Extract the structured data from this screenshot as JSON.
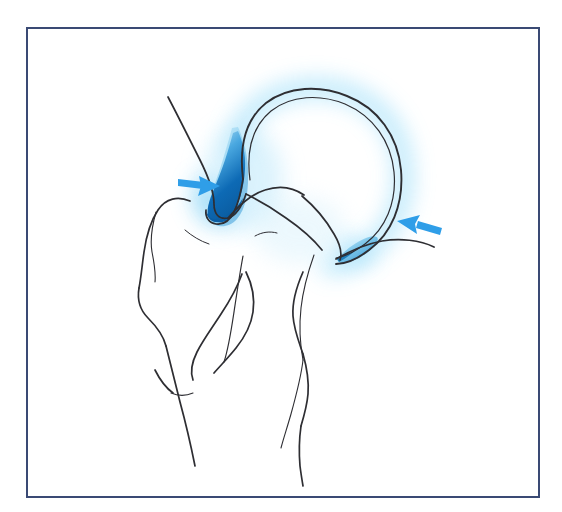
{
  "figure": {
    "kind": "anatomical-line-illustration",
    "subject": "shoulder joint (proximal humerus / glenohumeral joint), anterior view",
    "caption": "",
    "background_color": "#ffffff"
  },
  "frame": {
    "border_color": "#3a4a74",
    "border_width_px": 2,
    "x": 26,
    "y": 27,
    "width": 514,
    "height": 471,
    "fill": "#ffffff"
  },
  "palette": {
    "line_ink": "#2e2e33",
    "line_ink_soft": "#4a4a52",
    "arrow_blue": "#2f9ee8",
    "arrow_blue_dark": "#1b86d6",
    "highlight_deep_blue": "#0b64b0",
    "highlight_mid_blue": "#4aa8e0",
    "highlight_light_blue": "#9fd6f2",
    "glow_cyan": "#b9e8fb",
    "frame_navy": "#3a4a74"
  },
  "structures": [
    {
      "id": "humeral-head",
      "label": "humeral head",
      "render": "double-line arc with cyan glow halo",
      "stroke": "#2e2e33"
    },
    {
      "id": "articular-cartilage-line",
      "label": "articular cartilage surface (inner parallel line)",
      "render": "thin inner arc parallel to humeral head contour",
      "stroke": "#2e2e33"
    },
    {
      "id": "acromion-glenoid-margin",
      "label": "superior glenoid / acromial margin",
      "render": "descending curve from upper left",
      "stroke": "#2e2e33"
    },
    {
      "id": "greater-tuberosity",
      "label": "greater tuberosity",
      "render": "outline curve",
      "stroke": "#2e2e33"
    },
    {
      "id": "lesser-tuberosity",
      "label": "lesser tuberosity",
      "render": "outline curve",
      "stroke": "#2e2e33"
    },
    {
      "id": "bicipital-groove",
      "label": "intertubercular (bicipital) groove",
      "render": "paired vertical curves",
      "stroke": "#2e2e33"
    },
    {
      "id": "humeral-shaft",
      "label": "humeral shaft",
      "render": "two long descending cortical lines",
      "stroke": "#2e2e33"
    },
    {
      "id": "surgical-neck",
      "label": "surgical neck of humerus",
      "render": "narrowing between head and shaft",
      "stroke": "#2e2e33"
    }
  ],
  "highlights": [
    {
      "id": "superior-highlight",
      "label": "superior joint space highlight",
      "position": "superomedial, at the glenohumeral articulation",
      "shape": "crescent",
      "gradient_from": "#0b64b0",
      "gradient_to": "#9fd6f2",
      "glow": "#b9e8fb"
    },
    {
      "id": "inferior-lateral-highlight",
      "label": "inferolateral joint margin highlight",
      "position": "inferolateral, below the humeral head contour",
      "shape": "crescent",
      "gradient_from": "#3f9fd8",
      "gradient_to": "#cfeefb",
      "glow": "#b9e8fb"
    }
  ],
  "annotations": {
    "arrows": [
      {
        "id": "arrow-left",
        "label": "pointer to superior joint space highlight",
        "direction": "right",
        "tip_x": 219,
        "tip_y": 186,
        "tail_x": 180,
        "tail_y": 181,
        "color": "#2f9ee8"
      },
      {
        "id": "arrow-right",
        "label": "pointer to inferolateral joint margin highlight",
        "direction": "left",
        "tip_x": 398,
        "tip_y": 222,
        "tail_x": 438,
        "tail_y": 233,
        "color": "#2f9ee8"
      }
    ]
  }
}
